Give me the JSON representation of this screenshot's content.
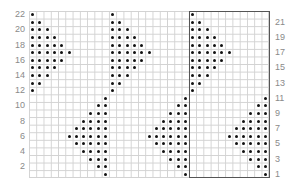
{
  "chart": {
    "type": "knitting-chart",
    "columns": 33,
    "rows": 22,
    "repeat_width": 11,
    "left_row_labels": [
      "22",
      "20",
      "18",
      "16",
      "14",
      "12",
      "10",
      "8",
      "6",
      "4",
      "2"
    ],
    "right_row_labels": [
      "21",
      "19",
      "17",
      "15",
      "13",
      "11",
      "9",
      "7",
      "5",
      "3",
      "1"
    ],
    "colors": {
      "grid": "#d2d2d2",
      "dot": "#111111",
      "label": "#8a8a8a",
      "repeat_border": "#555555"
    },
    "repeat_pattern": {
      "description": "Per 11-stitch repeat: upper triangle left-aligned rows 12-22, lower triangle right-aligned rows 1-11",
      "rows": {
        "22": [
          1
        ],
        "21": [
          1,
          2
        ],
        "20": [
          1,
          2,
          3
        ],
        "19": [
          1,
          2,
          3,
          4
        ],
        "18": [
          1,
          2,
          3,
          4,
          5
        ],
        "17": [
          1,
          2,
          3,
          4,
          5,
          6
        ],
        "16": [
          1,
          2,
          3,
          4,
          5
        ],
        "15": [
          1,
          2,
          3,
          4
        ],
        "14": [
          1,
          2,
          3
        ],
        "13": [
          1,
          2
        ],
        "12": [
          1
        ],
        "11": [
          11
        ],
        "10": [
          10,
          11
        ],
        "9": [
          9,
          10,
          11
        ],
        "8": [
          8,
          9,
          10,
          11
        ],
        "7": [
          7,
          8,
          9,
          10,
          11
        ],
        "6": [
          6,
          7,
          8,
          9,
          10,
          11
        ],
        "5": [
          7,
          8,
          9,
          10,
          11
        ],
        "4": [
          8,
          9,
          10,
          11
        ],
        "3": [
          9,
          10,
          11
        ],
        "2": [
          10,
          11
        ],
        "1": [
          11
        ]
      }
    }
  }
}
